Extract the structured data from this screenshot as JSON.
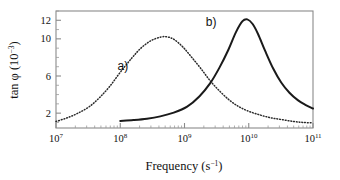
{
  "figure": {
    "name": "dielectric-loss-tangent-vs-frequency"
  },
  "chart_data": {
    "type": "line",
    "title": "",
    "xlabel": "Frequency (s⁻¹)",
    "xlabel_parts": {
      "text": "Frequency (s",
      "sup": "−1",
      "tail": ")"
    },
    "ylabel": "tan φ (10⁻³)",
    "ylabel_parts": {
      "head": "tan φ (10",
      "sup": "−3",
      "tail": ")"
    },
    "xscale": "log",
    "yscale": "linear",
    "xlim": [
      10000000.0,
      100000000000.0
    ],
    "ylim": [
      0.4,
      13.0
    ],
    "grid": false,
    "legend_position": "inline-annotations",
    "xticks": [
      {
        "value": 10000000.0,
        "label_base": "10",
        "label_exp": "7"
      },
      {
        "value": 100000000.0,
        "label_base": "10",
        "label_exp": "8"
      },
      {
        "value": 1000000000.0,
        "label_base": "10",
        "label_exp": "9"
      },
      {
        "value": 10000000000.0,
        "label_base": "10",
        "label_exp": "10"
      },
      {
        "value": 100000000000.0,
        "label_base": "10",
        "label_exp": "11"
      }
    ],
    "yticks_labeled": [
      {
        "value": 2,
        "label": "2"
      },
      {
        "value": 6,
        "label": "6"
      },
      {
        "value": 10,
        "label": "10"
      },
      {
        "value": 12,
        "label": "12"
      }
    ],
    "yticks_minor": [
      1,
      3,
      4,
      5,
      7,
      8,
      9,
      11,
      13
    ],
    "annotations": [
      {
        "text": "a)",
        "x": 110000000.0,
        "y": 6.6
      },
      {
        "text": "b)",
        "x": 2600000000.0,
        "y": 11.4
      }
    ],
    "series": [
      {
        "name": "a)",
        "style": "dotted",
        "color": "#2a2a2a",
        "peak_x": 500000000.0,
        "peak_y": 10.2,
        "x": [
          10000000.0,
          15000000.0,
          22000000.0,
          33000000.0,
          48000000.0,
          69000000.0,
          100000000.0,
          150000000.0,
          210000000.0,
          300000000.0,
          430000000.0,
          550000000.0,
          700000000.0,
          950000000.0,
          1300000000.0,
          1800000000.0,
          2500000000.0,
          3500000000.0,
          5000000000.0,
          7000000000.0,
          10000000000.0,
          15000000000.0,
          22000000000.0,
          33000000000.0,
          50000000000.0,
          70000000000.0,
          100000000000.0
        ],
        "y": [
          1.1,
          1.5,
          2.0,
          2.7,
          3.7,
          4.9,
          6.4,
          7.9,
          9.0,
          9.8,
          10.2,
          10.2,
          9.9,
          9.1,
          8.0,
          6.8,
          5.5,
          4.4,
          3.4,
          2.7,
          2.2,
          1.8,
          1.5,
          1.3,
          1.1,
          1.0,
          0.95
        ]
      },
      {
        "name": "b)",
        "style": "solid",
        "color": "#1a1a1a",
        "peak_x": 9000000000.0,
        "peak_y": 12.1,
        "x": [
          100000000.0,
          160000000.0,
          260000000.0,
          420000000.0,
          680000000.0,
          1100000000.0,
          1700000000.0,
          2500000000.0,
          3500000000.0,
          4800000000.0,
          6300000000.0,
          8000000000.0,
          9500000000.0,
          11500000000.0,
          14000000000.0,
          18000000000.0,
          24000000000.0,
          32000000000.0,
          43000000000.0,
          58000000000.0,
          76000000000.0,
          100000000000.0
        ],
        "y": [
          1.15,
          1.25,
          1.4,
          1.65,
          2.05,
          2.7,
          3.8,
          5.2,
          6.9,
          8.8,
          10.7,
          11.9,
          12.1,
          11.6,
          10.5,
          8.7,
          6.8,
          5.3,
          4.2,
          3.4,
          2.9,
          2.5
        ]
      }
    ]
  }
}
